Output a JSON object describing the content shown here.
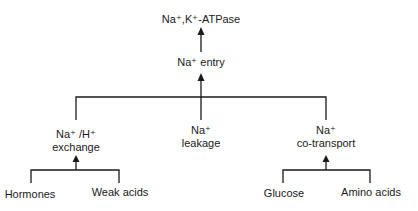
{
  "diagram": {
    "type": "flowchart",
    "root": {
      "label": "Na⁺,K⁺-ATPase"
    },
    "entry": {
      "label": "Na⁺ entry"
    },
    "pathways": [
      {
        "line1": "Na⁺ /H⁺",
        "line2": "exchange",
        "stimuli": [
          "Hormones",
          "Weak acids"
        ]
      },
      {
        "line1": "Na⁺",
        "line2": "leakage",
        "stimuli": []
      },
      {
        "line1": "Na⁺",
        "line2": "co-transport",
        "stimuli": [
          "Glucose",
          "Amino acids"
        ]
      }
    ],
    "edges": [
      {
        "from": "Na⁺ entry",
        "to": "Na⁺,K⁺-ATPase"
      },
      {
        "from": "Na⁺ /H⁺ exchange",
        "to": "Na⁺ entry"
      },
      {
        "from": "Na⁺ leakage",
        "to": "Na⁺ entry"
      },
      {
        "from": "Na⁺ co-transport",
        "to": "Na⁺ entry"
      },
      {
        "from": "Hormones",
        "to": "Na⁺ /H⁺ exchange"
      },
      {
        "from": "Weak acids",
        "to": "Na⁺ /H⁺ exchange"
      },
      {
        "from": "Glucose",
        "to": "Na⁺ co-transport"
      },
      {
        "from": "Amino acids",
        "to": "Na⁺ co-transport"
      }
    ],
    "line_color": "#1a1a1a"
  }
}
